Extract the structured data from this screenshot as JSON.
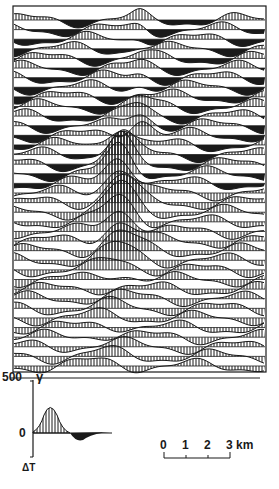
{
  "figure": {
    "profile_count": 37,
    "ink_color": "#1a1a1a",
    "paper_color": "#ffffff"
  },
  "amplitude_scale": {
    "top_value": "500",
    "unit": "γ",
    "zero_value": "0",
    "axis_label": "ΔT"
  },
  "distance_scale": {
    "ticks": [
      "0",
      "1",
      "2",
      "3"
    ],
    "unit": "km"
  }
}
